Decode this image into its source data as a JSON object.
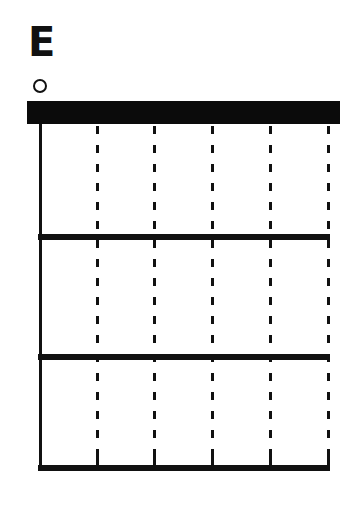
{
  "chord": {
    "name": "E",
    "string_markers": [
      "open",
      "",
      "",
      "",
      "",
      ""
    ]
  },
  "diagram": {
    "strings": 6,
    "frets_shown": 3,
    "nut": true,
    "first_string_style": "solid",
    "other_strings_style": "dashed",
    "colors": {
      "line": "#111111",
      "background": "#ffffff"
    }
  }
}
